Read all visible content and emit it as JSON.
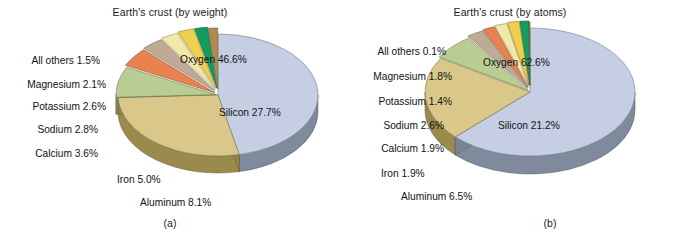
{
  "figure": {
    "background": "#ffffff",
    "text_color": "#121212"
  },
  "panels": [
    {
      "id": "a",
      "panel_label": "(a)",
      "title": "Earth's crust (by weight)",
      "inner_labels": [
        {
          "name": "oxygen-inner-label",
          "text": "Oxygen 46.6%"
        },
        {
          "name": "silicon-inner-label",
          "text": "Silicon 27.7%"
        }
      ],
      "callout_labels": [
        {
          "name": "all-others-label",
          "text": "All others 1.5%"
        },
        {
          "name": "magnesium-label",
          "text": "Magnesium 2.1%"
        },
        {
          "name": "potassium-label",
          "text": "Potassium 2.6%"
        },
        {
          "name": "sodium-label",
          "text": "Sodium 2.8%"
        },
        {
          "name": "calcium-label",
          "text": "Calcium 3.6%"
        },
        {
          "name": "iron-label",
          "text": "Iron 5.0%"
        },
        {
          "name": "aluminum-label",
          "text": "Aluminum 8.1%"
        }
      ]
    },
    {
      "id": "b",
      "panel_label": "(b)",
      "title": "Earth's crust (by atoms)",
      "inner_labels": [
        {
          "name": "oxygen-inner-label",
          "text": "Oxygen 62.6%"
        },
        {
          "name": "silicon-inner-label",
          "text": "Silicon 21.2%"
        }
      ],
      "callout_labels": [
        {
          "name": "all-others-label",
          "text": "All others 0.1%"
        },
        {
          "name": "magnesium-label",
          "text": "Magnesium 1.8%"
        },
        {
          "name": "potassium-label",
          "text": "Potassium 1.4%"
        },
        {
          "name": "sodium-label",
          "text": "Sodium 2.6%"
        },
        {
          "name": "calcium-label",
          "text": "Calcium 1.9%"
        },
        {
          "name": "iron-label",
          "text": "Iron 1.9%"
        },
        {
          "name": "aluminum-label",
          "text": "Aluminum 6.5%"
        }
      ]
    }
  ],
  "chart_data": [
    {
      "type": "pie",
      "title": "Earth's crust (by weight)",
      "subtitle": "(a)",
      "unit": "percent by weight",
      "categories": [
        "Oxygen",
        "Silicon",
        "Aluminum",
        "Iron",
        "Calcium",
        "Sodium",
        "Potassium",
        "Magnesium",
        "All others"
      ],
      "values": [
        46.6,
        27.7,
        8.1,
        5.0,
        3.6,
        2.8,
        2.6,
        2.1,
        1.5
      ],
      "labels": [
        "Oxygen 46.6%",
        "Silicon 27.7%",
        "Aluminum 8.1%",
        "Iron 5.0%",
        "Calcium 3.6%",
        "Sodium 2.8%",
        "Potassium 2.6%",
        "Magnesium 2.1%",
        "All others 1.5%"
      ],
      "colors": [
        "#c5cee3",
        "#d9c88a",
        "#b9cc91",
        "#e8824f",
        "#bfab95",
        "#f2e8a8",
        "#f0cf4d",
        "#139c5e",
        "#b08a50"
      ],
      "side_colors": [
        "#7f8a9c",
        "#9a8a4c",
        "#8b9b63",
        "#b35f33",
        "#8e7e6a",
        "#c3b878",
        "#c2a32c",
        "#0a6e41",
        "#7d5f33"
      ],
      "legend": "none",
      "grid": false,
      "three_d": true,
      "xlabel": "",
      "ylabel": ""
    },
    {
      "type": "pie",
      "title": "Earth's crust (by atoms)",
      "subtitle": "(b)",
      "unit": "percent by atoms",
      "categories": [
        "Oxygen",
        "Silicon",
        "Aluminum",
        "Sodium",
        "Calcium",
        "Iron",
        "Magnesium",
        "Potassium",
        "All others"
      ],
      "values": [
        62.6,
        21.2,
        6.5,
        2.6,
        1.9,
        1.9,
        1.8,
        1.4,
        0.1
      ],
      "labels": [
        "Oxygen 62.6%",
        "Silicon 21.2%",
        "Aluminum 6.5%",
        "Sodium 2.6%",
        "Calcium 1.9%",
        "Iron 1.9%",
        "Magnesium 1.8%",
        "Potassium 1.4%",
        "All others 0.1%"
      ],
      "colors": [
        "#c5cee3",
        "#d9c88a",
        "#b9cc91",
        "#bfab95",
        "#e8824f",
        "#f2e8a8",
        "#f0cf4d",
        "#139c5e",
        "#b08a50"
      ],
      "side_colors": [
        "#7f8a9c",
        "#9a8a4c",
        "#8b9b63",
        "#8e7e6a",
        "#b35f33",
        "#c3b878",
        "#c2a32c",
        "#0a6e41",
        "#7d5f33"
      ],
      "legend": "none",
      "grid": false,
      "three_d": true,
      "xlabel": "",
      "ylabel": ""
    }
  ]
}
